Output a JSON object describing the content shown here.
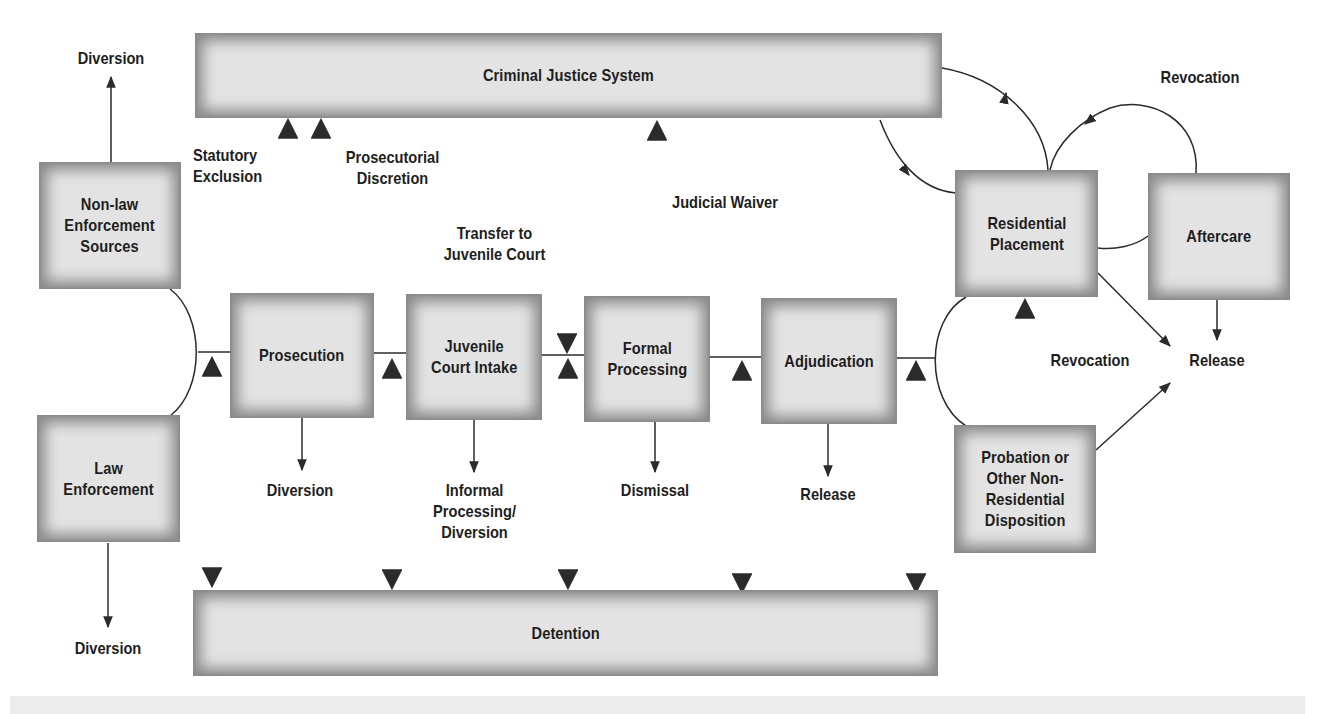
{
  "diagram": {
    "colors": {
      "box_fill": "#e3e3e3",
      "box_edge": "#8a8a8a",
      "line": "#2b2b2b",
      "background": "#ffffff"
    },
    "bars": {
      "criminal_justice_system": "Criminal Justice System",
      "detention": "Detention"
    },
    "boxes": {
      "non_law_enforcement": "Non-law\nEnforcement\nSources",
      "law_enforcement": "Law\nEnforcement",
      "prosecution": "Prosecution",
      "juvenile_court_intake": "Juvenile\nCourt Intake",
      "formal_processing": "Formal\nProcessing",
      "adjudication": "Adjudication",
      "residential_placement": "Residential\nPlacement",
      "aftercare": "Aftercare",
      "probation": "Probation or\nOther Non-\nResidential\nDisposition"
    },
    "labels": {
      "diversion_top": "Diversion",
      "diversion_bottom": "Diversion",
      "statutory_exclusion": "Statutory\nExclusion",
      "prosecutorial_discretion": "Prosecutorial\nDiscretion",
      "transfer_to_juvenile_court": "Transfer to\nJuvenile Court",
      "judicial_waiver": "Judicial Waiver",
      "prosecution_diversion": "Diversion",
      "informal_processing": "Informal\nProcessing/\nDiversion",
      "dismissal": "Dismissal",
      "adjudication_release": "Release",
      "revocation_top": "Revocation",
      "revocation_middle": "Revocation",
      "release_right": "Release"
    },
    "icons": {
      "arrow_up": "arrow-up",
      "arrow_down": "arrow-down",
      "double_arrow": "double-headed-arrow"
    }
  }
}
